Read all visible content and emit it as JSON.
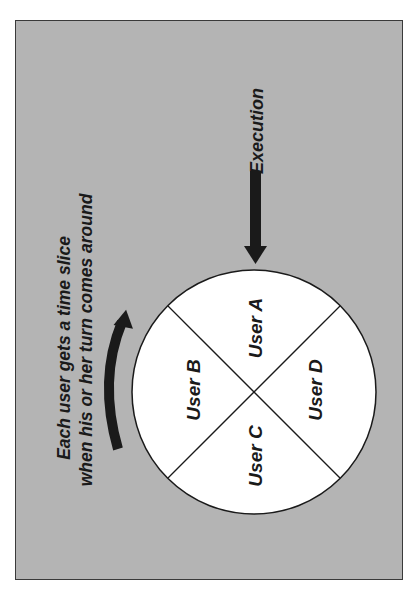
{
  "diagram": {
    "background_color": "#b4b4b4",
    "ink_color": "#1a1a1a",
    "execution_label": "Execution",
    "caption_line1": "Each user gets a time slice",
    "caption_line2": "when his or her turn comes around",
    "slices": [
      {
        "label": "User A"
      },
      {
        "label": "User B"
      },
      {
        "label": "User C"
      },
      {
        "label": "User D"
      }
    ]
  }
}
